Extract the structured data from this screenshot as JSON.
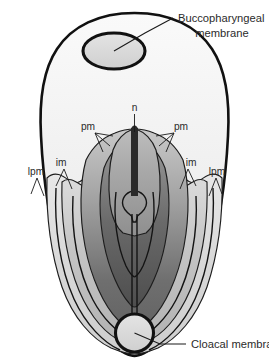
{
  "figure": {
    "kind": "embryology-diagram",
    "view": "dorsal view of trilaminar embryonic disc",
    "background_color": "#ffffff"
  },
  "callouts": [
    {
      "id": "buccopharyngeal",
      "line1": "Buccopharyngeal",
      "line2": "membrane",
      "text": "Buccopharyngeal membrane",
      "points_to": "oral-plate-oval"
    },
    {
      "id": "cloacal",
      "line1": "Cloacal membrane",
      "line2": "",
      "text": "Cloacal membrane",
      "points_to": "cloacal-circle"
    }
  ],
  "abbreviations": [
    {
      "id": "n",
      "label": "n",
      "meaning": "notochord",
      "side": "center"
    },
    {
      "id": "pm-left",
      "label": "pm",
      "meaning": "paraxial mesoderm",
      "side": "left"
    },
    {
      "id": "pm-right",
      "label": "pm",
      "meaning": "paraxial mesoderm",
      "side": "right"
    },
    {
      "id": "im-left",
      "label": "im",
      "meaning": "intermediate mesoderm",
      "side": "left"
    },
    {
      "id": "im-right",
      "label": "im",
      "meaning": "intermediate mesoderm",
      "side": "right"
    },
    {
      "id": "lpm-left",
      "label": "lpm",
      "meaning": "lateral plate mesoderm",
      "side": "left"
    },
    {
      "id": "lpm-right",
      "label": "lpm",
      "meaning": "lateral plate mesoderm",
      "side": "right"
    }
  ],
  "regions": [
    {
      "id": "disc-body",
      "name": "embryonic disc",
      "fill": "#f2f2f2"
    },
    {
      "id": "lpm-band",
      "name": "lateral plate mesoderm",
      "fill": "#d8d8d8"
    },
    {
      "id": "im-band",
      "name": "intermediate mesoderm",
      "fill": "#c0c0c0"
    },
    {
      "id": "pm-band",
      "name": "paraxial mesoderm",
      "fill": "#9a9a9a"
    },
    {
      "id": "notochord-field",
      "name": "notochordal field",
      "fill": "#b4b4b4"
    },
    {
      "id": "notochord-core",
      "name": "notochord",
      "fill": "#2a2a2a"
    },
    {
      "id": "oral-plate-oval",
      "name": "buccopharyngeal membrane",
      "fill": "#dcdcdc"
    },
    {
      "id": "cloacal-circle",
      "name": "cloacal membrane",
      "fill": "#e6e6e6"
    }
  ],
  "colors": {
    "ink": "#111111",
    "text": "#2b2b2b",
    "lightest": "#f2f2f2",
    "light": "#dcdcdc",
    "mid_light": "#c6c6c6",
    "mid": "#a6a6a6",
    "dark": "#6e6e6e",
    "darkest": "#4a4a4a",
    "notochord": "#2a2a2a"
  }
}
